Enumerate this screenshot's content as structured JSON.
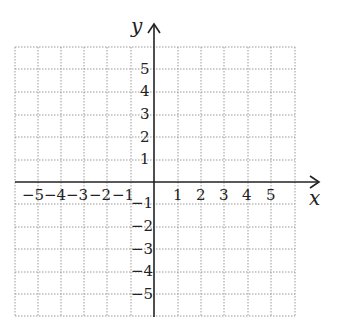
{
  "diagram": {
    "type": "coordinate-plane",
    "axes": {
      "x_label": "x",
      "y_label": "y"
    },
    "x_ticks": [
      "−5",
      "−4",
      "−3",
      "−2",
      "−1",
      "1",
      "2",
      "3",
      "4",
      "5"
    ],
    "y_ticks_positive": [
      "5",
      "4",
      "3",
      "2",
      "1"
    ],
    "y_ticks_negative": [
      "−1",
      "−2",
      "−3",
      "−4",
      "−5"
    ],
    "range": {
      "x": [
        -6,
        6
      ],
      "y": [
        -6,
        6
      ]
    },
    "grid": "dotted",
    "colors": {
      "axis": "#222222",
      "grid": "#9a9a9a"
    }
  }
}
